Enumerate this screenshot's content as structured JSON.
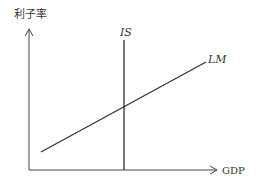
{
  "diagram": {
    "type": "IS-LM model",
    "y_axis_label": "利子率",
    "x_axis_label": "GDP",
    "curves": [
      {
        "name": "IS",
        "label": "IS",
        "shape": "vertical line"
      },
      {
        "name": "LM",
        "label": "LM",
        "shape": "upward sloping line"
      }
    ],
    "colors": {
      "line": "#333333",
      "background": "#ffffff"
    }
  }
}
